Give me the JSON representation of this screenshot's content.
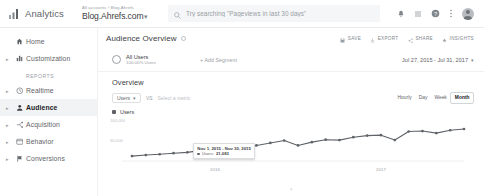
{
  "topbar": {
    "logo_text": "Analytics",
    "account_breadcrumb": "All accounts › Blog.Ahrefs",
    "property_name": "Blog.Ahrefs.com",
    "property_caret": "▾",
    "search_placeholder": "Try searching \"Pageviews in last 30 days\"",
    "icons": {
      "notifications": "bell-icon",
      "apps": "apps-grid-icon",
      "help": "help-icon",
      "more": "kebab-menu-icon",
      "avatar": "user-avatar"
    }
  },
  "sidebar": {
    "items": [
      {
        "label": "Home",
        "icon": "home-icon",
        "caret": "",
        "active": false
      },
      {
        "label": "Customization",
        "icon": "customization-icon",
        "caret": "▸",
        "active": false
      }
    ],
    "section_label": "Reports",
    "report_items": [
      {
        "label": "Realtime",
        "icon": "realtime-clock-icon",
        "caret": "▸",
        "active": false
      },
      {
        "label": "Audience",
        "icon": "audience-person-icon",
        "caret": "▸",
        "active": true
      },
      {
        "label": "Acquisition",
        "icon": "acquisition-icon",
        "caret": "▸",
        "active": false
      },
      {
        "label": "Behavior",
        "icon": "behavior-icon",
        "caret": "▸",
        "active": false
      },
      {
        "label": "Conversions",
        "icon": "conversions-flag-icon",
        "caret": "▸",
        "active": false
      }
    ]
  },
  "main": {
    "page_title": "Audience Overview",
    "actions": [
      {
        "label": "SAVE",
        "icon": "save-icon"
      },
      {
        "label": "EXPORT",
        "icon": "export-icon"
      },
      {
        "label": "SHARE",
        "icon": "share-icon"
      },
      {
        "label": "INSIGHTS",
        "icon": "insights-icon"
      }
    ],
    "segment": {
      "name": "All Users",
      "sub": "100.00% Users",
      "add_segment": "+ Add Segment"
    },
    "date_range": {
      "text": "Jul 27, 2015 - Jul 31, 2017",
      "caret": "▾"
    },
    "overview_title": "Overview",
    "metric_selector": {
      "primary": "Users",
      "caret": "▾",
      "vs": "VS",
      "secondary_placeholder": "Select a metric"
    },
    "granularity": [
      {
        "label": "Hourly",
        "active": false
      },
      {
        "label": "Day",
        "active": false
      },
      {
        "label": "Week",
        "active": false
      },
      {
        "label": "Month",
        "active": true
      }
    ],
    "legend": {
      "label": "Users"
    },
    "tooltip": {
      "title": "Nov 1, 2015 - Nov 30, 2015",
      "metric": "Users:",
      "value": "21,083"
    },
    "scroll_hint": "▾"
  },
  "chart_data": {
    "type": "line",
    "title": "Overview",
    "xlabel": "",
    "ylabel": "Users",
    "ylim": [
      0,
      100000
    ],
    "yticks": [
      50000,
      100000
    ],
    "ytick_labels": [
      "50,000",
      "100,000"
    ],
    "grid": false,
    "legend": [
      "Users"
    ],
    "legend_position": "top-left",
    "x_axis_labels": [
      "2016",
      "2017"
    ],
    "series": [
      {
        "name": "Users",
        "color": "#5f6368",
        "x": [
          "Jul 2015",
          "Aug 2015",
          "Sep 2015",
          "Oct 2015",
          "Nov 2015",
          "Dec 2015",
          "Jan 2016",
          "Feb 2016",
          "Mar 2016",
          "Apr 2016",
          "May 2016",
          "Jun 2016",
          "Jul 2016",
          "Aug 2016",
          "Sep 2016",
          "Oct 2016",
          "Nov 2016",
          "Dec 2016",
          "Jan 2017",
          "Feb 2017",
          "Mar 2017",
          "Apr 2017",
          "May 2017",
          "Jun 2017",
          "Jul 2017"
        ],
        "values": [
          12000,
          14500,
          16500,
          19000,
          21083,
          26000,
          30000,
          31000,
          31500,
          38000,
          44000,
          50000,
          38000,
          46000,
          52000,
          51000,
          58000,
          62000,
          63000,
          51000,
          72000,
          73000,
          68000,
          75000,
          78000
        ]
      }
    ],
    "highlight_point": {
      "x": "Nov 2015",
      "value": 21083
    }
  }
}
